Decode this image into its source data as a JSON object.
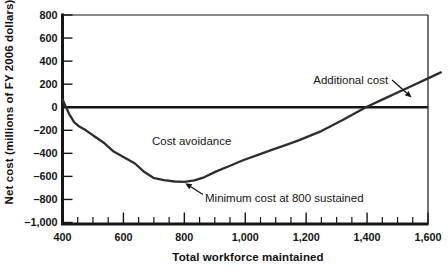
{
  "figure": {
    "background": "#ffffff",
    "ink": "#161616",
    "curve_color": "#2e2e2e"
  },
  "chart_data": {
    "type": "line",
    "title": "",
    "xlabel": "Total workforce maintained",
    "ylabel": "Net cost (millions of FY 2006 dollars)",
    "xlim": [
      400,
      1600
    ],
    "ylim": [
      -1000,
      800
    ],
    "grid": false,
    "zero_line": true,
    "x_minor_step": 50,
    "x_ticks": [
      {
        "value": 400,
        "label": "400"
      },
      {
        "value": 600,
        "label": "600"
      },
      {
        "value": 800,
        "label": "800"
      },
      {
        "value": 1000,
        "label": "1,000"
      },
      {
        "value": 1200,
        "label": "1,200"
      },
      {
        "value": 1400,
        "label": "1,400"
      },
      {
        "value": 1600,
        "label": "1,600"
      }
    ],
    "y_ticks": [
      {
        "value": 800,
        "label": "800"
      },
      {
        "value": 600,
        "label": "600"
      },
      {
        "value": 400,
        "label": "400"
      },
      {
        "value": 200,
        "label": "200"
      },
      {
        "value": 0,
        "label": "0"
      },
      {
        "value": -200,
        "label": "–200"
      },
      {
        "value": -400,
        "label": "–400"
      },
      {
        "value": -600,
        "label": "–600"
      },
      {
        "value": -800,
        "label": "–800"
      },
      {
        "value": -1000,
        "label": "–1,000"
      }
    ],
    "series": [
      {
        "name": "Net cost curve",
        "points": [
          [
            400,
            70
          ],
          [
            410,
            10
          ],
          [
            422,
            -60
          ],
          [
            438,
            -130
          ],
          [
            455,
            -168
          ],
          [
            478,
            -203
          ],
          [
            508,
            -258
          ],
          [
            538,
            -313
          ],
          [
            568,
            -385
          ],
          [
            603,
            -437
          ],
          [
            638,
            -488
          ],
          [
            668,
            -560
          ],
          [
            698,
            -612
          ],
          [
            733,
            -633
          ],
          [
            768,
            -644
          ],
          [
            800,
            -648
          ],
          [
            833,
            -634
          ],
          [
            865,
            -608
          ],
          [
            905,
            -557
          ],
          [
            950,
            -508
          ],
          [
            995,
            -458
          ],
          [
            1040,
            -415
          ],
          [
            1085,
            -372
          ],
          [
            1130,
            -330
          ],
          [
            1175,
            -288
          ],
          [
            1250,
            -207
          ],
          [
            1320,
            -112
          ],
          [
            1396,
            0
          ],
          [
            1455,
            72
          ],
          [
            1520,
            152
          ],
          [
            1600,
            250
          ],
          [
            1642,
            302
          ]
        ]
      }
    ],
    "key_points": {
      "minimum": {
        "x": 800,
        "y": -648
      },
      "zero_crossings": [
        412,
        1396
      ]
    },
    "annotations": [
      {
        "id": "cost-avoidance",
        "text": "Cost avoidance",
        "x": 694,
        "y": -328,
        "anchor": "start",
        "arrow": null
      },
      {
        "id": "minimum-cost",
        "text": "Minimum cost at 800 sustained",
        "x": 868,
        "y": -822,
        "anchor": "start",
        "arrow": {
          "from": [
            861,
            -757
          ],
          "to": [
            803,
            -660
          ]
        }
      },
      {
        "id": "additional-cost",
        "text": "Additional cost",
        "x": 1469,
        "y": 201,
        "anchor": "end",
        "arrow": {
          "from": [
            1482,
            236
          ],
          "to": [
            1546,
            85
          ]
        }
      }
    ]
  }
}
